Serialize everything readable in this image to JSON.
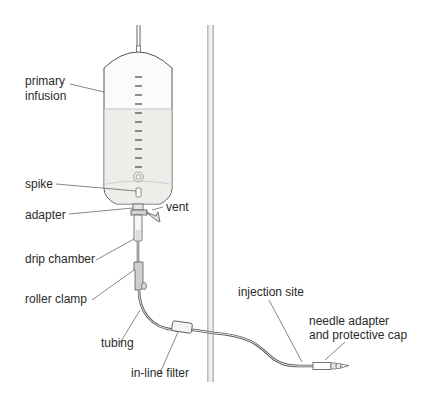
{
  "diagram": {
    "type": "labeled-illustration",
    "colors": {
      "line": "#555555",
      "fluid": "#eceae6",
      "bag": "#fafafa",
      "component": "#cfcfcf",
      "pole": "#9a9a9a",
      "text": "#2a2a2a"
    },
    "labels": {
      "primary_infusion_1": "primary",
      "primary_infusion_2": "infusion",
      "spike": "spike",
      "adapter": "adapter",
      "vent": "vent",
      "drip_chamber": "drip chamber",
      "roller_clamp": "roller clamp",
      "tubing": "tubing",
      "inline_filter": "in-line filter",
      "injection_site": "injection site",
      "needle_adapter_1": "needle adapter",
      "needle_adapter_2": "and protective cap"
    }
  }
}
